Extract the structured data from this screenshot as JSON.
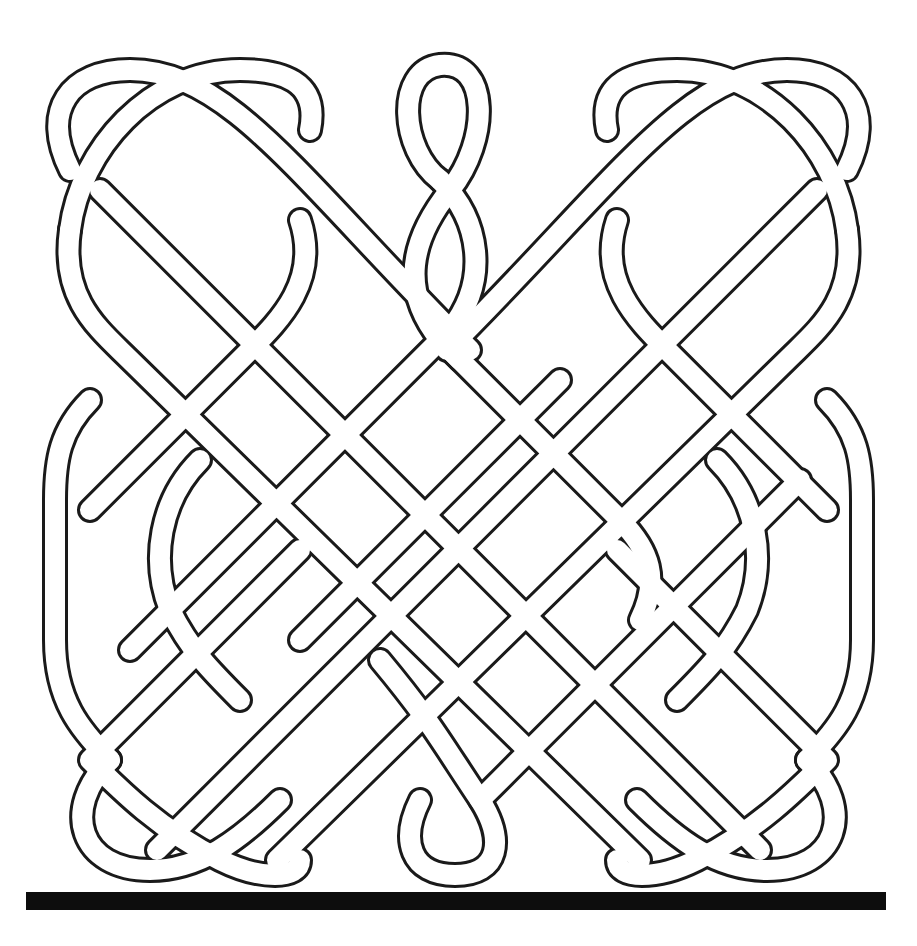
{
  "colors": {
    "background": "#ffffff",
    "line": "#1a1a1a",
    "band_fill": "#ffffff",
    "base_bar": "#0d0d0d"
  },
  "elements": {
    "left_knot": "double-loop interlace with rounded outer side",
    "center_knot": "figure-eight twist column",
    "right_knot": "double-loop interlace with rounded outer side",
    "base_bar": "solid black horizontal bar"
  }
}
